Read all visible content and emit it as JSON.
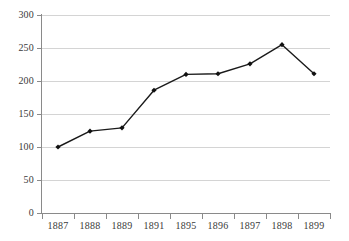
{
  "chart_data": {
    "type": "line",
    "title": "",
    "subtitle": "",
    "xlabel": "",
    "ylabel": "",
    "categories": [
      "1887",
      "1888",
      "1889",
      "1891",
      "1895",
      "1896",
      "1897",
      "1898",
      "1899"
    ],
    "values": [
      100,
      124,
      129,
      186,
      210,
      211,
      226,
      255,
      211
    ],
    "series": [
      {
        "name": "",
        "values": [
          100,
          124,
          129,
          186,
          210,
          211,
          226,
          255,
          211
        ]
      }
    ],
    "ylim": [
      0,
      300
    ],
    "yticks": [
      0,
      50,
      100,
      150,
      200,
      250,
      300
    ],
    "ytick_labels": [
      "0",
      "50",
      "100",
      "150",
      "200",
      "250",
      "300"
    ],
    "grid": "horizontal",
    "legend": "none",
    "marker": "diamond",
    "line_color": "#1a1a1a",
    "grid_color": "#d4d4d4",
    "axis_color": "#8a8a8a",
    "background_color": "#ffffff",
    "annotations": []
  }
}
